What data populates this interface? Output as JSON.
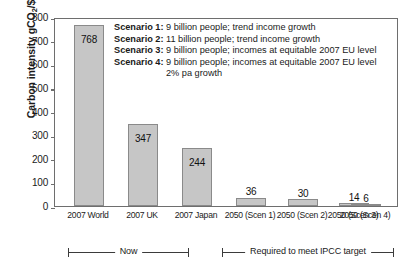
{
  "chart_data": {
    "type": "bar",
    "title": "",
    "xlabel": "",
    "ylabel": "Carbon intensity gCO2/$",
    "ylabel_prefix": "Carbon intensity gCO",
    "ylabel_sub": "2",
    "ylabel_suffix": "/$",
    "ylim": [
      0,
      800
    ],
    "yticks": [
      0,
      100,
      200,
      300,
      400,
      500,
      600,
      700,
      800
    ],
    "ytick_labels": [
      "0",
      "100",
      "200",
      "300",
      "400",
      "500",
      "600",
      "700",
      "800"
    ],
    "grid": false,
    "legend_position": "inside-upper-right",
    "categories": [
      "2007 World",
      "2007 UK",
      "2007 Japan",
      "2050 (Scen 1)",
      "2050 (Scen 2)",
      "2050 (Scen 3)",
      "2050 (Scen 4)"
    ],
    "values": [
      768,
      347,
      244,
      36,
      30,
      14,
      6
    ],
    "value_labels": [
      "768",
      "347",
      "244",
      "36",
      "30",
      "14",
      "6"
    ],
    "value_label_placement": [
      "inside",
      "inside",
      "inside",
      "above",
      "above",
      "above",
      "above"
    ],
    "bar_color": "#c6c6c6",
    "bar_edge_color": "#8a8a8a",
    "axis_color": "#6e6e6e"
  },
  "legend": {
    "lines": [
      {
        "key": "Scenario 1:",
        "text": "9 billion people; trend income growth"
      },
      {
        "key": "Scenario 2:",
        "text": "11 billion people; trend income growth"
      },
      {
        "key": "Scenario 3:",
        "text": "9 billion people; incomes at equitable 2007 EU level"
      },
      {
        "key": "Scenario 4:",
        "text": "9 billion people; incomes at equitable 2007 EU level"
      }
    ],
    "continuation": "2% pa growth"
  },
  "annotations": {
    "brackets": [
      {
        "label": "Now"
      },
      {
        "label": "Required to meet IPCC target"
      }
    ]
  }
}
